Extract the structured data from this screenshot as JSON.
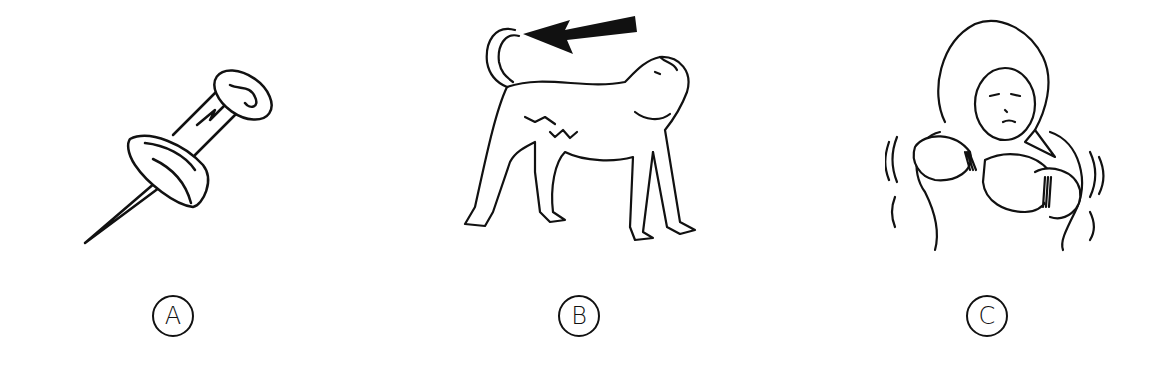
{
  "options": [
    {
      "letter": "A",
      "picture": "push-pin"
    },
    {
      "letter": "B",
      "picture": "dog-with-arrow-pointing-at-tail"
    },
    {
      "letter": "C",
      "picture": "child-in-hood-shivering-from-cold"
    }
  ],
  "colors": {
    "ink": "#111111",
    "background": "#ffffff"
  }
}
